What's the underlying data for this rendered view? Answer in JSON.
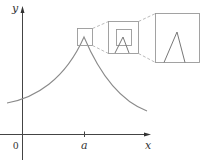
{
  "diagram": {
    "axes": {
      "x_label": "x",
      "y_label": "y",
      "origin_label": "0",
      "tick_label": "a"
    },
    "colors": {
      "axis": "#444444",
      "curve": "#888888",
      "box": "#999999",
      "dashed": "#aaaaaa",
      "text": "#333333"
    },
    "zoom_levels": 3
  }
}
